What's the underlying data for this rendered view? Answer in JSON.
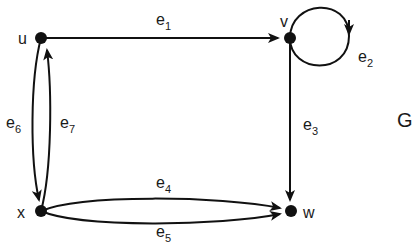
{
  "graph": {
    "name": "G",
    "stroke_color": "#111111",
    "nodes": [
      {
        "id": "u",
        "label": "u"
      },
      {
        "id": "v",
        "label": "v"
      },
      {
        "id": "w",
        "label": "w"
      },
      {
        "id": "x",
        "label": "x"
      }
    ],
    "edges": [
      {
        "id": "e1",
        "base": "e",
        "sub": "1",
        "from": "u",
        "to": "v"
      },
      {
        "id": "e2",
        "base": "e",
        "sub": "2",
        "from": "v",
        "to": "v"
      },
      {
        "id": "e3",
        "base": "e",
        "sub": "3",
        "from": "v",
        "to": "w"
      },
      {
        "id": "e4",
        "base": "e",
        "sub": "4",
        "from": "x",
        "to": "w"
      },
      {
        "id": "e5",
        "base": "e",
        "sub": "5",
        "from": "x",
        "to": "w"
      },
      {
        "id": "e6",
        "base": "e",
        "sub": "6",
        "from": "u",
        "to": "x"
      },
      {
        "id": "e7",
        "base": "e",
        "sub": "7",
        "from": "x",
        "to": "u"
      }
    ]
  }
}
